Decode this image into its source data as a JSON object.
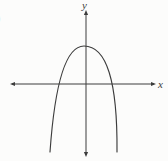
{
  "figure": {
    "ink_color": "#3c3c3c",
    "background_color": "#fcfcfb",
    "x_axis_label": "x",
    "y_axis_label": "y",
    "edge_fragment": ")",
    "geometry": {
      "x_axis_path": "M 12 84 L 154 84",
      "y_axis_path": "M 86 13 L 86 155",
      "curve_path": "M 50 152 Q 57.5 46 84 46 Q 117.9 46 117 152",
      "arrow_left": "10,84 15,81.9 15,86.1",
      "arrow_right": "156,84 151,81.9 151,86.1",
      "arrow_top": "86,10 83.9,15 88.1,15",
      "arrow_bottom": "86,157 83.9,152 88.1,152"
    }
  },
  "chart_data": {
    "type": "line",
    "title": "",
    "xlabel": "x",
    "ylabel": "y",
    "axis_ticks": "none (unlabeled sketch)",
    "grid": false,
    "legend": false,
    "opens": "down",
    "vertex": [
      -0.1,
      1.9
    ],
    "x_intercepts": [
      -1.35,
      1.3
    ],
    "xlim": [
      -3.75,
      3.5
    ],
    "ylim": [
      -3.65,
      3.7
    ],
    "series": [
      {
        "name": "parabola",
        "x": [
          -1.8,
          -1.55,
          -1.35,
          -1.19,
          -0.7,
          -0.1,
          0.64,
          1.16,
          1.3,
          1.46,
          1.55
        ],
        "y": [
          -3.4,
          -1.08,
          0,
          0.58,
          1.57,
          1.9,
          1.57,
          0.58,
          0,
          -1.08,
          -3.4
        ]
      }
    ]
  }
}
